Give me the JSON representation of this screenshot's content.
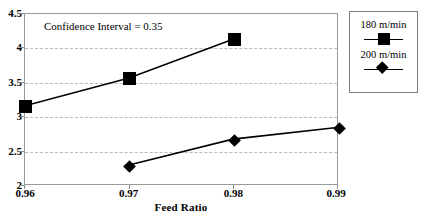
{
  "chart_data": {
    "type": "line",
    "title": "",
    "xlabel": "Feed Ratio",
    "ylabel": "",
    "x": [
      0.96,
      0.97,
      0.98,
      0.99
    ],
    "xtick_labels": [
      "0.96",
      "0.97",
      "0.98",
      "0.99"
    ],
    "ytick_labels": [
      "4.5",
      "4",
      "3.5",
      "3",
      "2.5",
      "2"
    ],
    "ytick_values": [
      4.5,
      4,
      3.5,
      3,
      2.5,
      2
    ],
    "xlim": [
      0.96,
      0.99
    ],
    "ylim": [
      2,
      4.5
    ],
    "grid": "horizontal-dashed",
    "legend_position": "right-outside",
    "series": [
      {
        "name": "180 m/min",
        "marker": "square",
        "color": "#000000",
        "x": [
          0.96,
          0.97,
          0.98
        ],
        "values": [
          3.15,
          3.56,
          4.13
        ]
      },
      {
        "name": "200 m/min",
        "marker": "diamond",
        "color": "#000000",
        "x": [
          0.97,
          0.98,
          0.99
        ],
        "values": [
          2.28,
          2.66,
          2.83
        ]
      }
    ],
    "annotations": [
      {
        "text": "Confidence Interval = 0.35",
        "x": 0.962,
        "y": 4.38
      }
    ]
  },
  "axes": {
    "x_title": "Feed Ratio",
    "x_ticks": [
      "0.96",
      "0.97",
      "0.98",
      "0.99"
    ],
    "y_ticks": [
      "4.5",
      "4",
      "3.5",
      "3",
      "2.5",
      "2"
    ]
  },
  "annotation": {
    "confidence_interval": "Confidence Interval = 0.35"
  },
  "legend": {
    "entries": [
      {
        "label": "180 m/min",
        "marker": "square-marker"
      },
      {
        "label": "200 m/min",
        "marker": "diamond-marker"
      }
    ]
  },
  "colors": {
    "series": "#000000",
    "grid": "#b9b9b9",
    "frame": "#9a9a9a",
    "background": "#ffffff"
  }
}
